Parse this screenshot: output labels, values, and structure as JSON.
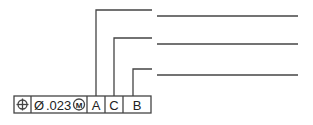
{
  "feature_control_frame": {
    "symbol": "position",
    "diameter": "Ø",
    "tolerance": ".023",
    "modifier": "M",
    "datums": [
      "A",
      "C",
      "B"
    ]
  },
  "leader_lines": [
    {
      "datum": "A",
      "order": 1
    },
    {
      "datum": "C",
      "order": 2
    },
    {
      "datum": "B",
      "order": 3
    }
  ],
  "annotation_lines": 3,
  "colors": {
    "line": "#444444",
    "text": "#222222"
  }
}
